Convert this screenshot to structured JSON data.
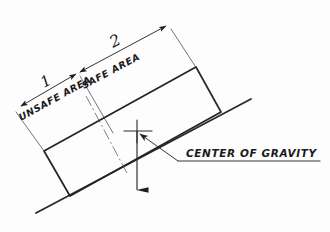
{
  "diagram": {
    "background_color": "#fdfdfd",
    "ink_color": "#1f1f1f",
    "labels": {
      "unsafe_area": "UNSAFE AREA",
      "safe_area": "SAFE AREA",
      "center_of_gravity": "CENTER OF GRAVITY",
      "dim_unsafe_value": "1",
      "dim_safe_value": "2"
    },
    "elements": {
      "ground_line": "ground-slope-line",
      "body_rectangle": "tilted-rectangular-body",
      "centerline": "dash-dot-centerline",
      "gravity_vector": "downward-gravity-arrow",
      "cg_marker": "center-of-gravity-crosshair",
      "leader_line": "cg-leader-line",
      "dimension_chain": "unsafe-safe-dimension-chain"
    }
  }
}
